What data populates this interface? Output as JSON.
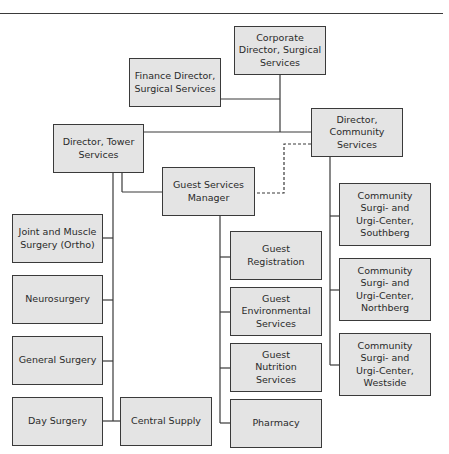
{
  "diagram": {
    "type": "org-chart",
    "nodes": {
      "corporate": "Corporate\nDirector, Surgical\nServices",
      "finance": "Finance Director,\nSurgical Services",
      "tower": "Director, Tower\nServices",
      "community": "Director,\nCommunity\nServices",
      "guest_mgr": "Guest Services\nManager",
      "joint": "Joint and Muscle\nSurgery (Ortho)",
      "neuro": "Neurosurgery",
      "general": "General Surgery",
      "day": "Day Surgery",
      "central": "Central Supply",
      "registration": "Guest\nRegistration",
      "environmental": "Guest\nEnvironmental\nServices",
      "nutrition": "Guest\nNutrition Services",
      "pharmacy": "Pharmacy",
      "southberg": "Community\nSurgi- and\nUrgi-Center,\nSouthberg",
      "northberg": "Community\nSurgi- and\nUrgi-Center,\nNorthberg",
      "westside": "Community\nSurgi- and\nUrgi-Center,\nWestside"
    },
    "edges": [
      {
        "from": "corporate",
        "to": "finance",
        "style": "solid"
      },
      {
        "from": "corporate",
        "to": "tower",
        "style": "solid"
      },
      {
        "from": "corporate",
        "to": "community",
        "style": "solid"
      },
      {
        "from": "tower",
        "to": "guest_mgr",
        "style": "solid"
      },
      {
        "from": "community",
        "to": "guest_mgr",
        "style": "dashed"
      },
      {
        "from": "tower",
        "to": "joint",
        "style": "solid"
      },
      {
        "from": "tower",
        "to": "neuro",
        "style": "solid"
      },
      {
        "from": "tower",
        "to": "general",
        "style": "solid"
      },
      {
        "from": "tower",
        "to": "day",
        "style": "solid"
      },
      {
        "from": "tower",
        "to": "central",
        "style": "solid"
      },
      {
        "from": "guest_mgr",
        "to": "registration",
        "style": "solid"
      },
      {
        "from": "guest_mgr",
        "to": "environmental",
        "style": "solid"
      },
      {
        "from": "guest_mgr",
        "to": "nutrition",
        "style": "solid"
      },
      {
        "from": "guest_mgr",
        "to": "pharmacy",
        "style": "solid"
      },
      {
        "from": "community",
        "to": "southberg",
        "style": "solid"
      },
      {
        "from": "community",
        "to": "northberg",
        "style": "solid"
      },
      {
        "from": "community",
        "to": "westside",
        "style": "solid"
      }
    ]
  },
  "colors": {
    "box_fill": "#e4e4e4",
    "line": "#3a3a3a"
  }
}
